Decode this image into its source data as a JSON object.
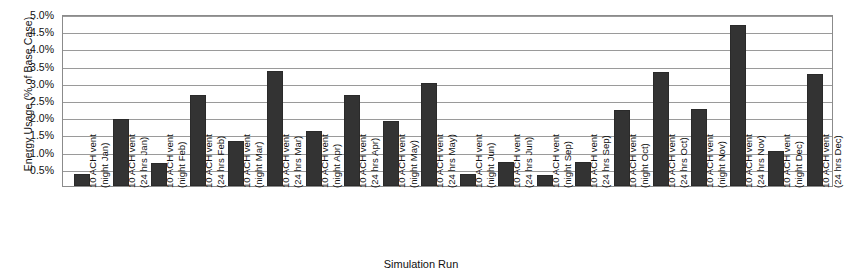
{
  "chart_data": {
    "type": "bar",
    "title": "",
    "xlabel": "Simulation Run",
    "ylabel": "Energy Usage (% of Base Case)",
    "ylim": [
      0,
      5.0
    ],
    "ytick_labels": [
      "5.0%",
      "4.5%",
      "4.0%",
      "3.5%",
      "3.0%",
      "2.5%",
      "2.0%",
      "1.5%",
      "1.0%",
      "0.5%"
    ],
    "ytick_values": [
      5.0,
      4.5,
      4.0,
      3.5,
      3.0,
      2.5,
      2.0,
      1.5,
      1.0,
      0.5
    ],
    "grid": true,
    "legend": "none",
    "bar_color": "#333333",
    "categories": [
      "10 ACH vent (night Jan)",
      "10 ACH vent (24 hrs Jan)",
      "10 ACH vent (night Feb)",
      "10 ACH vent (24 hrs Feb)",
      "10 ACH vent (night Mar)",
      "10 ACH vent (24 hrs Mar)",
      "10 ACH vent (night Apr)",
      "10 ACH vent (24 hrs Apr)",
      "10 ACH vent (night May)",
      "10 ACH vent (24 hrs May)",
      "10 ACH vent (night Jun)",
      "10 ACH vent (24 hrs Jun)",
      "10 ACH vent (night Sep)",
      "10 ACH vent (24 hrs Sep)",
      "10 ACH vent (night Oct)",
      "10 ACH vent (24 hrs Oct)",
      "10 ACH vent (night Nov)",
      "10 ACH vent (24 hrs Nov)",
      "10 ACH vent (night Dec)",
      "10 ACH vent (24 hrs Dec)"
    ],
    "category_lines": [
      [
        "10 ACH vent",
        "(night Jan)"
      ],
      [
        "10 ACH vent",
        "(24 hrs Jan)"
      ],
      [
        "10 ACH vent",
        "(night Feb)"
      ],
      [
        "10 ACH vent",
        "(24 hrs Feb)"
      ],
      [
        "10 ACH vent",
        "(night Mar)"
      ],
      [
        "10 ACH vent",
        "(24 hrs Mar)"
      ],
      [
        "10 ACH vent",
        "(night Apr)"
      ],
      [
        "10 ACH vent",
        "(24 hrs Apr)"
      ],
      [
        "10 ACH vent",
        "(night May)"
      ],
      [
        "10 ACH vent",
        "(24 hrs May)"
      ],
      [
        "10 ACH vent",
        "(night Jun)"
      ],
      [
        "10 ACH vent",
        "(24 hrs Jun)"
      ],
      [
        "10 ACH vent",
        "(night Sep)"
      ],
      [
        "10 ACH vent",
        "(24 hrs Sep)"
      ],
      [
        "10 ACH vent",
        "(night Oct)"
      ],
      [
        "10 ACH vent",
        "(24 hrs Oct)"
      ],
      [
        "10 ACH vent",
        "(night Nov)"
      ],
      [
        "10 ACH vent",
        "(24 hrs Nov)"
      ],
      [
        "10 ACH vent",
        "(night Dec)"
      ],
      [
        "10 ACH vent",
        "(24 hrs Dec)"
      ]
    ],
    "values": [
      0.35,
      1.95,
      0.68,
      2.65,
      1.3,
      3.35,
      1.6,
      2.65,
      1.9,
      3.0,
      0.35,
      0.7,
      0.33,
      0.7,
      2.2,
      3.3,
      2.25,
      4.68,
      1.02,
      3.25
    ]
  }
}
